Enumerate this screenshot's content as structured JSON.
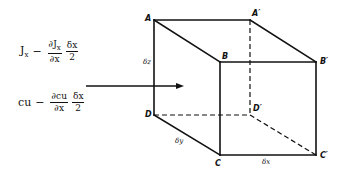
{
  "formulas": {
    "flux": {
      "term": "J",
      "term_sub": "x",
      "minus": "−",
      "frac1_num": "∂J",
      "frac1_num_sub": "x",
      "frac1_den": "∂x",
      "frac2_num": "δx",
      "frac2_den": "2"
    },
    "concentration": {
      "term": "cu",
      "minus": "−",
      "frac1_num": "∂cu",
      "frac1_den": "∂x",
      "frac2_num": "δx",
      "frac2_den": "2"
    }
  },
  "cube": {
    "vertices": {
      "A": "A",
      "B": "B",
      "C": "C",
      "D": "D",
      "A_prime": "A′",
      "B_prime": "B′",
      "C_prime": "C′",
      "D_prime": "D′"
    },
    "dimensions": {
      "dz": "δz",
      "dy": "δy",
      "dx": "δx"
    }
  },
  "arrow": {
    "direction": "right"
  }
}
